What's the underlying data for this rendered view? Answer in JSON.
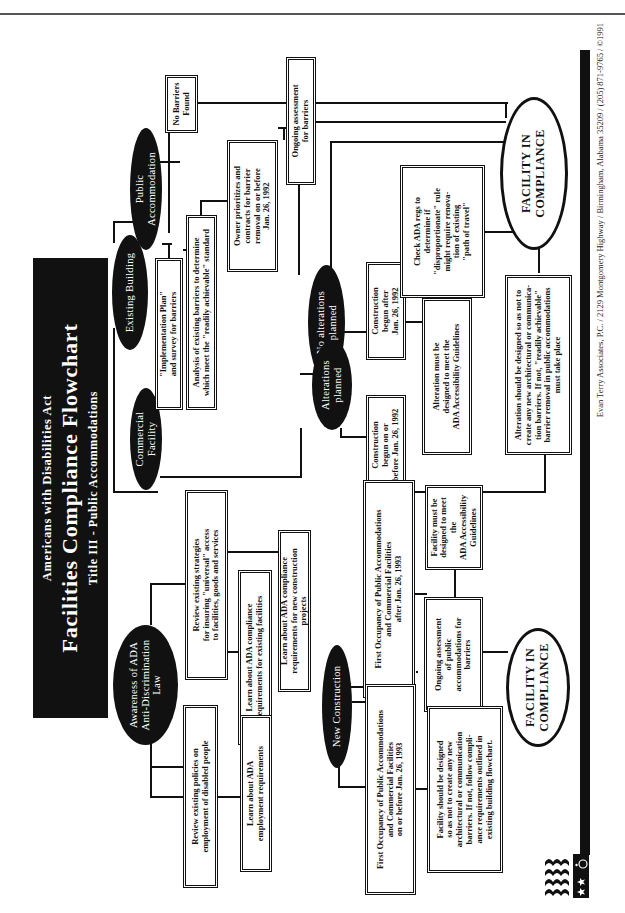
{
  "title": {
    "supertitle": "Americans with Disabilities Act",
    "main": "Facilities Compliance Flowchart",
    "subtitle": "Title III - Public Accommodations"
  },
  "nodes": {
    "awareness": "Awareness of ADA\nAnti-Discrimination\nLaw",
    "review_strategies": "Review  existing strategies\nfor insuring \"universal\" access\nto  facilities, goods and services",
    "learn_existing": "Learn about ADA compliance\nrequirements for existing facilities",
    "learn_new_construction": "Learn about ADA compliance\nrequirements for new construction projects",
    "review_policies": "Review existing policies on\nemployment of disabled people",
    "learn_employment": "Learn about ADA\nemployment requirements",
    "existing_building": "Existing Building",
    "public_accommodation": "Public\nAccommodation",
    "commercial_facility": "Commercial\nFacility",
    "no_barriers_found": "No Barriers\nFound",
    "implementation_plan": "\"Implementation Plan\"\nand survey for barriers",
    "analysis": "Analysis of existing barriers to determine\nwhich meet the \"readily achievable\" standard",
    "owner_prioritizes": "Owner prioritizes and\ncontracts for barrier\nremoval on or before\nJan. 26, 1992",
    "ongoing_assessment": "Ongoing assessment\nfor barriers",
    "no_alterations": "No alterations\nplanned",
    "alterations_planned": "Alterations\nplanned",
    "construction_after": "Construction\nbegun after\nJan. 26, 1992",
    "construction_before": "Construction\nbegun on or\nbefore Jan. 26, 1992",
    "alteration_must": "Alteration must be\ndesigned to meet the\nADA Accessibility Guidelines",
    "check_ada_regs": "Check ADA regs to\ndetermine if\n\"disproportionate\" rule\nmight require renova-\ntion of existing\n\"path of travel\"",
    "alteration_should": "Alteration should be designed so as not  to\ncreate any new architectural or communica-\ntion barriers.  If not, \"readily achievable\"\nbarrier removal in public accommodations\nmust take place",
    "compliance_top": "FACILITY  IN\nCOMPLIANCE",
    "new_construction": "New Construction",
    "first_occupancy_after": "First Occupancy of Public Accommodations\nand Commercial Facilities\nafter Jan. 26, 1993",
    "first_occupancy_before": "First Occupancy of Public Accommodations\nand Commercial Facilities\non or before Jan. 26, 1993",
    "facility_must": "Facility must be\ndesigned to meet the\nADA  Accessibility\nGuidelines",
    "ongoing_public": "Ongoing assessment\nof public\naccommodations for\nbarriers",
    "facility_should": "Facility should be designed\nso as not to create any new\narchitectural or communication\nbarriers.  If not, follow compli-\nance requirements outlined in\nexisting building flowchart.",
    "compliance_bottom": "FACILITY  IN\nCOMPLIANCE"
  },
  "footer": {
    "credit": "Evan Terry Associates, P.C. / 2129 Montgomery Highway / Birmingham, Alabama 35209 / (205) 871-9765 / ©1991"
  },
  "logo": {
    "name": "flag-accessibility-logo"
  }
}
